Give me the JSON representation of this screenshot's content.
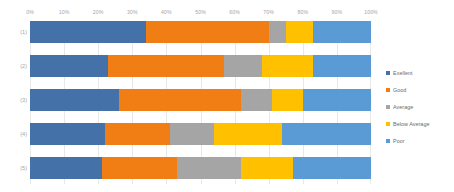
{
  "chart_data": {
    "type": "bar",
    "orientation": "horizontal",
    "stacked": true,
    "stack_mode": "percent",
    "title": "",
    "subtitle": "",
    "xlabel": "",
    "ylabel": "",
    "xlim": [
      0,
      100
    ],
    "grid": true,
    "legend_position": "right",
    "categories": [
      "(1)",
      "(2)",
      "(3)",
      "(4)",
      "(5)"
    ],
    "x_tick_labels": [
      "0%",
      "10%",
      "20%",
      "30%",
      "40%",
      "50%",
      "60%",
      "70%",
      "80%",
      "90%",
      "100%"
    ],
    "x_tick_values": [
      0,
      10,
      20,
      30,
      40,
      50,
      60,
      70,
      80,
      90,
      100
    ],
    "series": [
      {
        "name": "Exellent",
        "color": "#4472A8",
        "values": [
          34,
          23,
          26,
          22,
          21
        ]
      },
      {
        "name": "Good",
        "color": "#F07E15",
        "values": [
          36,
          34,
          36,
          19,
          22
        ]
      },
      {
        "name": "Average",
        "color": "#A5A5A5",
        "values": [
          5,
          11,
          9,
          13,
          19
        ]
      },
      {
        "name": "Below Average",
        "color": "#FFC000",
        "values": [
          8,
          15,
          9,
          20,
          15
        ]
      },
      {
        "name": "Poor",
        "color": "#5B9BD5",
        "values": [
          17,
          17,
          20,
          26,
          23
        ]
      }
    ]
  },
  "legend": {
    "items": [
      {
        "label": "Exellent",
        "color": "#4472A8"
      },
      {
        "label": "Good",
        "color": "#F07E15"
      },
      {
        "label": "Average",
        "color": "#A5A5A5"
      },
      {
        "label": "Below Average",
        "color": "#FFC000"
      },
      {
        "label": "Poor",
        "color": "#5B9BD5"
      }
    ]
  },
  "axis": {
    "tick_color": "#a6a6a6",
    "gridline_color": "#e8e8e8"
  }
}
